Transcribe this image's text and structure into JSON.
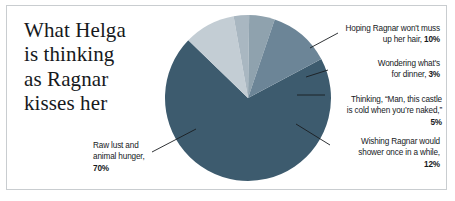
{
  "title": {
    "lines": [
      "What Helga",
      "is thinking",
      "as Ragnar",
      "kisses her"
    ]
  },
  "chart_data": {
    "type": "pie",
    "title": "What Helga is thinking as Ragnar kisses her",
    "xlabel": "",
    "ylabel": "",
    "legend_position": "callout-labels",
    "grid": false,
    "categories": [
      "Raw lust and animal hunger",
      "Hoping Ragnar won't muss up her hair",
      "Wondering what's for dinner",
      "Thinking, “Man, this castle is cold when you’re naked,”",
      "Wishing Ragnar would shower once in a while"
    ],
    "values": [
      70,
      10,
      3,
      5,
      12
    ],
    "colors": [
      "#3d5b6e",
      "#c3cdd4",
      "#a9b7c1",
      "#8fa2ae",
      "#6c8597"
    ]
  },
  "callouts": {
    "hair": {
      "line1": "Hoping Ragnar won't muss",
      "line2": "up her hair, ",
      "pct": "10%"
    },
    "dinner": {
      "line1": "Wondering what's",
      "line2": "for dinner, ",
      "pct": "3%"
    },
    "castle": {
      "line1": "Thinking, “Man, this castle",
      "line2": "is cold when you’re naked,”",
      "pct": "5%"
    },
    "shower": {
      "line1": "Wishing Ragnar would",
      "line2": "shower once in a while,",
      "pct": "12%"
    },
    "lust": {
      "line1": "Raw lust and",
      "line2": "animal hunger,",
      "pct": "70%"
    }
  }
}
